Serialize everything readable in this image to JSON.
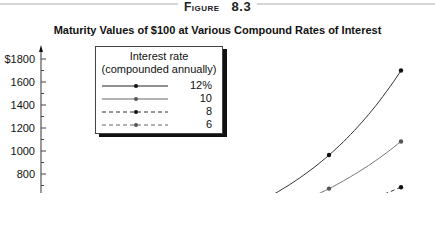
{
  "figure": {
    "label_word": "Figure",
    "label_number": "8.3"
  },
  "chart_data": {
    "type": "line",
    "title": "Maturity Values of $100 at Various Compound Rates of Interest",
    "xlabel": "",
    "ylabel": "",
    "x": [
      0,
      5,
      10,
      15,
      20,
      25
    ],
    "series": [
      {
        "name": "12%",
        "style": "solid",
        "marker_color": "#111111",
        "values": [
          100,
          176,
          311,
          547,
          965,
          1700
        ]
      },
      {
        "name": "10",
        "style": "solid",
        "marker_color": "#555555",
        "values": [
          100,
          161,
          259,
          418,
          673,
          1083
        ]
      },
      {
        "name": "8",
        "style": "dashed",
        "marker_color": "#111111",
        "values": [
          100,
          147,
          216,
          317,
          466,
          685
        ]
      },
      {
        "name": "6",
        "style": "dashed",
        "marker_color": "#555555",
        "values": [
          100,
          134,
          179,
          240,
          321,
          429
        ]
      }
    ],
    "y_ticks": [
      "$1800",
      "1600",
      "1400",
      "1200",
      "1000",
      "800"
    ],
    "y_tick_values": [
      1800,
      1600,
      1400,
      1200,
      1000,
      800
    ],
    "ylim": [
      0,
      1800
    ],
    "grid": false,
    "legend": {
      "title_line1": "Interest rate",
      "title_line2": "(compounded annually)",
      "position": "upper-left",
      "entries": [
        "12%",
        "10",
        "8",
        "6"
      ]
    }
  }
}
